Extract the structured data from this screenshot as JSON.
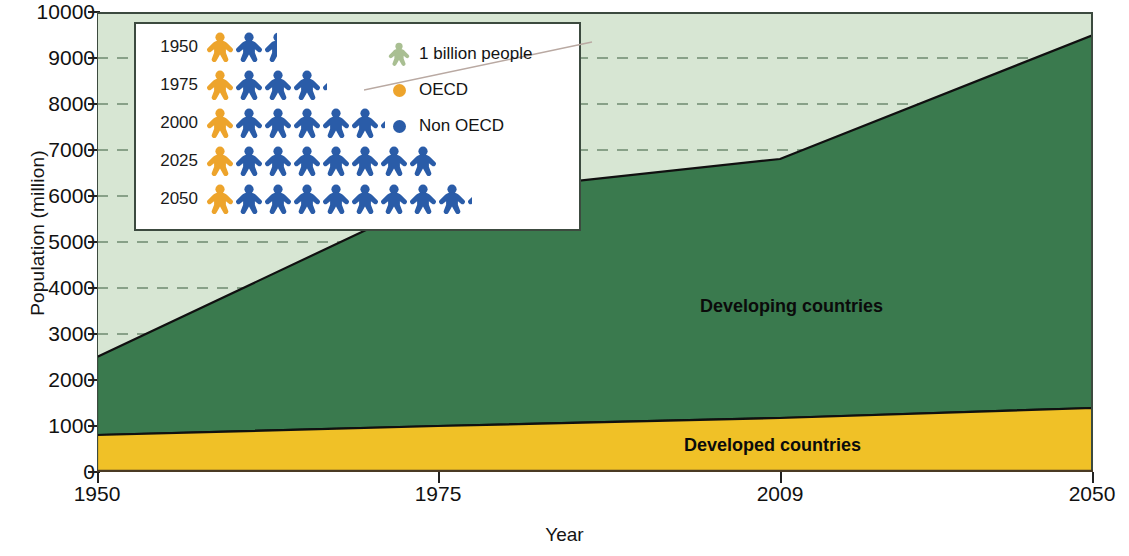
{
  "chart_data": {
    "type": "area",
    "title": "",
    "xlabel": "Year",
    "ylabel": "Population (million)",
    "xlim": [
      1950,
      2050
    ],
    "ylim": [
      0,
      10000
    ],
    "xticks": [
      1950,
      1975,
      2009,
      2050
    ],
    "yticks": [
      0,
      1000,
      2000,
      3000,
      4000,
      5000,
      6000,
      7000,
      8000,
      9000,
      10000
    ],
    "grid": "dashed horizontal gridlines visible above the stacked areas",
    "stacked": true,
    "x": [
      1950,
      1975,
      2009,
      2050
    ],
    "series": [
      {
        "name": "Developed countries",
        "color": "#f0c127",
        "values": [
          800,
          1000,
          1230,
          1400
        ]
      },
      {
        "name": "Developing countries",
        "color": "#3a7a4e",
        "values": [
          1700,
          3100,
          5570,
          7800
        ]
      }
    ],
    "totals": [
      2500,
      4100,
      6800,
      9200
    ],
    "background_color": "#d7e6d3",
    "annotations": [
      "Developing countries",
      "Developed countries"
    ]
  },
  "axes": {
    "y_title": "Population (million)",
    "x_title": "Year",
    "y_ticks": [
      "10000",
      "9000",
      "8000",
      "7000",
      "6000",
      "5000",
      "4000",
      "3000",
      "2000",
      "1000",
      "0"
    ],
    "x_ticks": [
      "1950",
      "1975",
      "2009",
      "2050"
    ]
  },
  "area_labels": {
    "developing": "Developing countries",
    "developed": "Developed countries"
  },
  "inset": {
    "legend": [
      {
        "label": "1 billion people",
        "icon": "person-icon",
        "color": "#a9bf92"
      },
      {
        "label": "OECD",
        "icon": "dot-icon",
        "color": "#eda42c"
      },
      {
        "label": "Non OECD",
        "icon": "dot-icon",
        "color": "#2a5ca8"
      }
    ],
    "unit_note": "1 billion people",
    "rows": [
      {
        "year": "1950",
        "oecd": 1,
        "non_oecd": 1.5,
        "total_billion": 2.5
      },
      {
        "year": "1975",
        "oecd": 1,
        "non_oecd": 3.1,
        "total_billion": 4.1
      },
      {
        "year": "2000",
        "oecd": 1,
        "non_oecd": 5.1,
        "total_billion": 6.1
      },
      {
        "year": "2025",
        "oecd": 1,
        "non_oecd": 7.0,
        "total_billion": 8.0
      },
      {
        "year": "2050",
        "oecd": 1,
        "non_oecd": 8.2,
        "total_billion": 9.2
      }
    ]
  },
  "colors": {
    "developed": "#f0c127",
    "developing": "#3a7a4e",
    "plot_background": "#d7e6d3",
    "oecd": "#eda42c",
    "non_oecd": "#2a5ca8",
    "unit_figure": "#a9bf92",
    "axis": "#1a1a1a"
  }
}
